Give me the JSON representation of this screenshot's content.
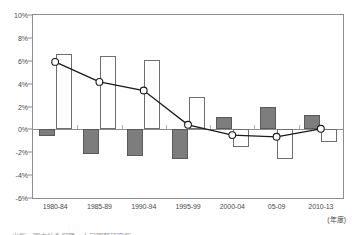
{
  "chart_data": {
    "type": "bar",
    "title": "",
    "subtitle": "",
    "xlabel": "(年度)",
    "ylabel": "",
    "ylim": [
      -6,
      10
    ],
    "ytick_step": 2,
    "grid": false,
    "legend_position": "none",
    "categories": [
      "1980-84",
      "1985-89",
      "1990-94",
      "1995-99",
      "2000-04",
      "05-09",
      "2010-13"
    ],
    "ytick_labels": [
      "10%",
      "8%",
      "6%",
      "4%",
      "2%",
      "0%",
      "-2%",
      "-4%",
      "-6%"
    ],
    "ytick_values": [
      10,
      8,
      6,
      4,
      2,
      0,
      -2,
      -4,
      -6
    ],
    "series": [
      {
        "name": "gray-bar-series",
        "kind": "bar",
        "style": "filled-gray",
        "color": "#7d7d7d",
        "values": [
          -0.55,
          -2.15,
          -2.35,
          -2.6,
          1.1,
          2.0,
          1.3
        ]
      },
      {
        "name": "white-bar-series",
        "kind": "bar",
        "style": "outlined-white",
        "color": "#ffffff",
        "border_color": "#6e6e6e",
        "values": [
          6.6,
          6.4,
          6.05,
          2.85,
          -1.55,
          -2.6,
          -1.1
        ]
      },
      {
        "name": "line-series",
        "kind": "line",
        "style": "line-with-open-circle-markers",
        "color": "#1a1a1a",
        "marker_fill": "#ffffff",
        "values": [
          5.9,
          4.15,
          3.4,
          0.4,
          -0.5,
          -0.65,
          0.05
        ]
      }
    ]
  },
  "axes": {
    "x_unit_label": "(年度)"
  },
  "footer": {
    "source_note": "出所：国立社会保障・人口問題研究所"
  }
}
